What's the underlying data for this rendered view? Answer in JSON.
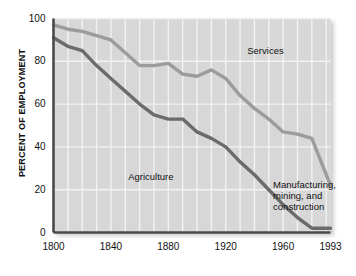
{
  "chart_data": {
    "type": "line",
    "title": "",
    "xlabel": "",
    "ylabel": "PERCENT OF EMPLOYMENT",
    "xlim": [
      1800,
      1993
    ],
    "ylim": [
      0,
      100
    ],
    "grid": true,
    "x_ticks": [
      "1800",
      "1840",
      "1880",
      "1920",
      "1960",
      "1993"
    ],
    "x_tick_values": [
      1800,
      1840,
      1880,
      1920,
      1960,
      1993
    ],
    "y_ticks": [
      "0",
      "20",
      "40",
      "60",
      "80",
      "100"
    ],
    "y_tick_values": [
      0,
      20,
      40,
      60,
      80,
      100
    ],
    "legend_position": "inline-annotations",
    "series": [
      {
        "name": "Services",
        "color": "#9c9c9c",
        "label_text": "Services",
        "x": [
          1800,
          1810,
          1820,
          1830,
          1840,
          1850,
          1860,
          1870,
          1880,
          1890,
          1900,
          1910,
          1920,
          1930,
          1940,
          1950,
          1960,
          1970,
          1980,
          1993
        ],
        "values": [
          97,
          95,
          94,
          92,
          90,
          84,
          78,
          78,
          79,
          74,
          73,
          76,
          72,
          64,
          58,
          53,
          47,
          46,
          44,
          22
        ]
      },
      {
        "name": "Agriculture",
        "color": "#6b6b6b",
        "label_text": "Agriculture",
        "x": [
          1800,
          1810,
          1820,
          1830,
          1840,
          1850,
          1860,
          1870,
          1880,
          1890,
          1900,
          1910,
          1920,
          1930,
          1940,
          1950,
          1960,
          1970,
          1980,
          1993
        ],
        "values": [
          91,
          87,
          85,
          78,
          72,
          66,
          60,
          55,
          53,
          53,
          47,
          44,
          40,
          33,
          27,
          20,
          13,
          7,
          2,
          2
        ]
      }
    ],
    "annotations": [
      {
        "text": "Services",
        "x": 1935,
        "y": 85
      },
      {
        "text": "Agriculture",
        "x": 1852,
        "y": 26
      },
      {
        "text": "Manufacturing,\nmining, and\nconstruction",
        "x": 1953,
        "y": 22
      }
    ]
  },
  "colors": {
    "plot_background": "#d7d7d7",
    "grid": "#f2f2f2",
    "axis": "#4a4a4a",
    "services": "#9c9c9c",
    "agriculture": "#6b6b6b",
    "text": "#111111"
  }
}
